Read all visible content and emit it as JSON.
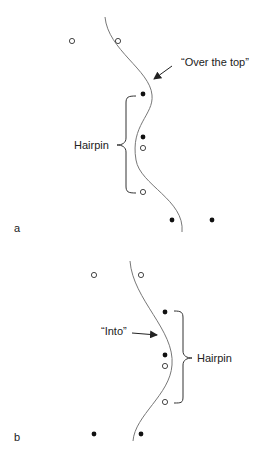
{
  "panels": [
    {
      "id": "a",
      "panel_label": "a",
      "annotation": "“Over the top”",
      "bracket_label": "Hairpin",
      "open_points": [
        [
          72,
          41
        ],
        [
          118,
          41
        ],
        [
          143,
          148
        ],
        [
          143,
          192
        ]
      ],
      "filled_points": [
        [
          143,
          94
        ],
        [
          143,
          137
        ],
        [
          172,
          220
        ],
        [
          212,
          220
        ]
      ]
    },
    {
      "id": "b",
      "panel_label": "b",
      "annotation": "“Into”",
      "bracket_label": "Hairpin",
      "open_points": [
        [
          94,
          275
        ],
        [
          141,
          275
        ],
        [
          165,
          366
        ],
        [
          165,
          402
        ]
      ],
      "filled_points": [
        [
          165,
          312
        ],
        [
          165,
          355
        ],
        [
          94,
          434
        ],
        [
          141,
          434
        ]
      ]
    }
  ],
  "colors": {
    "line": "#777777",
    "ink": "#222222",
    "background": "#ffffff"
  }
}
